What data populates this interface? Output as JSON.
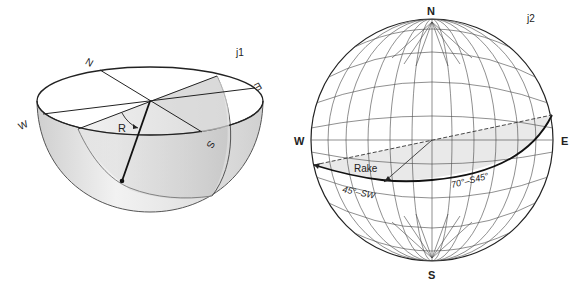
{
  "figure_left": {
    "panel_label": "j1",
    "compass": {
      "north": "N",
      "east": "E",
      "south": "S",
      "west": "W"
    },
    "angle_label": "R",
    "description": "Block diagram of a lower hemisphere with an inclined plane and rake angle R"
  },
  "figure_right": {
    "panel_label": "j2",
    "compass": {
      "north": "N",
      "east": "E",
      "south": "S",
      "west": "W"
    },
    "rake_label": "Rake",
    "lineation_label": "45°–SW",
    "plane_label": "70°–S45°E",
    "plane_label_display": "70°–S45°",
    "description": "Equal-angle stereonet (Wulff net) showing a great circle and rake of a lineation"
  },
  "colors": {
    "line": "#222222",
    "grid": "#444444",
    "shade_light": "#ececec",
    "shade_mid": "#d4d4d4",
    "shade_dark": "#bdbdbd"
  }
}
